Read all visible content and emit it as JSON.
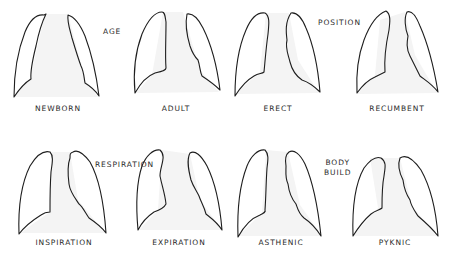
{
  "figure": {
    "sections": {
      "age": "AGE",
      "position": "POSITION",
      "respiration": "RESPIRATION",
      "body_build_line1": "BODY",
      "body_build_line2": "BUILD"
    },
    "row1": [
      {
        "id": "newborn",
        "label": "NEWBORN",
        "group": "AGE"
      },
      {
        "id": "adult",
        "label": "ADULT",
        "group": "AGE"
      },
      {
        "id": "erect",
        "label": "ERECT",
        "group": "POSITION"
      },
      {
        "id": "recumbent",
        "label": "RECUMBENT",
        "group": "POSITION"
      }
    ],
    "row2": [
      {
        "id": "inspiration",
        "label": "INSPIRATION",
        "group": "RESPIRATION"
      },
      {
        "id": "expiration",
        "label": "EXPIRATION",
        "group": "RESPIRATION"
      },
      {
        "id": "asthenic",
        "label": "ASTHENIC",
        "group": "BODY BUILD"
      },
      {
        "id": "pyknic",
        "label": "PYKNIC",
        "group": "BODY BUILD"
      }
    ],
    "colors": {
      "outline": "#1e1e1e",
      "text": "#2a2a2a",
      "background": "#ffffff",
      "mediastinum_shade": "#f4f4f4"
    }
  }
}
